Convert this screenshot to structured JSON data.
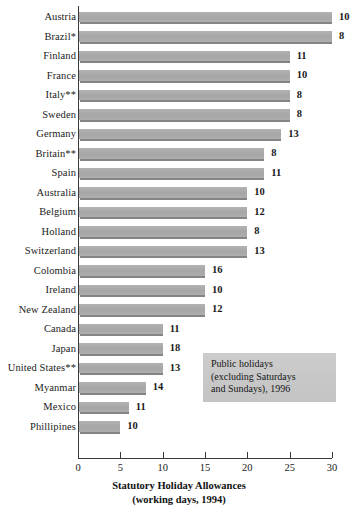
{
  "chart_data": {
    "type": "bar",
    "orientation": "horizontal",
    "title": "Statutory Holiday Allowances",
    "subtitle": "(working days, 1994)",
    "xlabel": "Statutory Holiday Allowances (working days, 1994)",
    "ylabel": "",
    "xlim": [
      0,
      30
    ],
    "xticks": [
      0,
      5,
      10,
      15,
      20,
      25,
      30
    ],
    "grid": false,
    "legend": false,
    "bar_color": "#ababab",
    "categories": [
      "Austria",
      "Brazil*",
      "Finland",
      "France",
      "Italy**",
      "Sweden",
      "Germany",
      "Britain**",
      "Spain",
      "Australia",
      "Belgium",
      "Holland",
      "Switzerland",
      "Colombia",
      "Ireland",
      "New Zealand",
      "Canada",
      "Japan",
      "United States**",
      "Myanmar",
      "Mexico",
      "Phillipines"
    ],
    "values": [
      30,
      30,
      25,
      25,
      25,
      25,
      24,
      22,
      22,
      20,
      20,
      20,
      20,
      15,
      15,
      15,
      10,
      10,
      10,
      8,
      6,
      5
    ],
    "series": [
      {
        "name": "Statutory holiday allowance (working days, 1994)",
        "values": [
          30,
          30,
          25,
          25,
          25,
          25,
          24,
          22,
          22,
          20,
          20,
          20,
          20,
          15,
          15,
          15,
          10,
          10,
          10,
          8,
          6,
          5
        ]
      },
      {
        "name": "Public holidays (excluding Saturdays and Sundays), 1996",
        "values": [
          10,
          8,
          11,
          10,
          8,
          8,
          13,
          8,
          11,
          10,
          12,
          8,
          13,
          16,
          10,
          12,
          11,
          18,
          13,
          14,
          11,
          10
        ]
      }
    ],
    "data_labels": [
      "10",
      "8",
      "11",
      "10",
      "8",
      "8",
      "13",
      "8",
      "11",
      "10",
      "12",
      "8",
      "13",
      "16",
      "10",
      "12",
      "11",
      "18",
      "13",
      "14",
      "11",
      "10"
    ],
    "annotations": [
      "Public holidays",
      "(excluding Saturdays",
      "and Sundays), 1996"
    ],
    "footnotes": [
      "*",
      "**"
    ]
  },
  "annotation_box": {
    "line1": "Public holidays",
    "line2": "(excluding Saturdays",
    "line3": "and Sundays), 1996"
  },
  "axis": {
    "title_line1": "Statutory Holiday Allowances",
    "title_line2": "(working days, 1994)",
    "ticks": [
      "0",
      "5",
      "10",
      "15",
      "20",
      "25",
      "30"
    ]
  }
}
